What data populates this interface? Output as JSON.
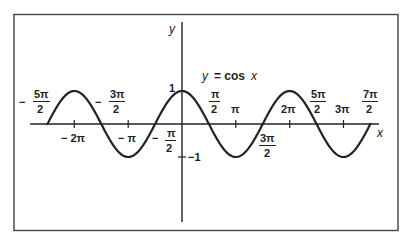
{
  "chart_data": {
    "type": "line",
    "title": "y = cos x",
    "xlabel": "x",
    "ylabel": "y",
    "function": "cos",
    "xlim_radians": [
      -7.854,
      10.996
    ],
    "ylim": [
      -1,
      1
    ],
    "x_range_plotted": [
      "-5π/2",
      "7π/2"
    ],
    "grid": false,
    "legend": null,
    "series": [
      {
        "name": "y = cos x",
        "x": [
          -7.854,
          -6.283,
          -4.712,
          -3.142,
          -1.571,
          0,
          1.571,
          3.142,
          4.712,
          6.283,
          7.854,
          9.425,
          10.996
        ],
        "x_labels": [
          "-5π/2",
          "-2π",
          "-3π/2",
          "-π",
          "-π/2",
          "0",
          "π/2",
          "π",
          "3π/2",
          "2π",
          "5π/2",
          "3π",
          "7π/2"
        ],
        "values": [
          0,
          1,
          0,
          -1,
          0,
          1,
          0,
          -1,
          0,
          1,
          0,
          -1,
          0
        ]
      }
    ],
    "x_tick_labels": [
      {
        "num": "5π",
        "den": "2",
        "sign": "−",
        "value": -7.854,
        "position": "above"
      },
      {
        "num": "2π",
        "den": "",
        "sign": "−",
        "value": -6.283,
        "position": "below"
      },
      {
        "num": "3π",
        "den": "2",
        "sign": "−",
        "value": -4.712,
        "position": "above"
      },
      {
        "num": "π",
        "den": "",
        "sign": "−",
        "value": -3.142,
        "position": "below"
      },
      {
        "num": "π",
        "den": "2",
        "sign": "−",
        "value": -1.571,
        "position": "below"
      },
      {
        "num": "π",
        "den": "2",
        "sign": "",
        "value": 1.571,
        "position": "above"
      },
      {
        "num": "π",
        "den": "",
        "sign": "",
        "value": 3.142,
        "position": "above"
      },
      {
        "num": "3π",
        "den": "2",
        "sign": "",
        "value": 4.712,
        "position": "below"
      },
      {
        "num": "2π",
        "den": "",
        "sign": "",
        "value": 6.283,
        "position": "above"
      },
      {
        "num": "5π",
        "den": "2",
        "sign": "",
        "value": 7.854,
        "position": "above"
      },
      {
        "num": "3π",
        "den": "",
        "sign": "",
        "value": 9.425,
        "position": "above"
      },
      {
        "num": "7π",
        "den": "2",
        "sign": "",
        "value": 10.996,
        "position": "above"
      }
    ],
    "y_tick_labels": [
      "1",
      "−1"
    ],
    "annotations": [
      "y = cos x"
    ]
  },
  "labels": {
    "equation": "y = cos x",
    "x_axis": "x",
    "y_axis": "y",
    "y_one": "1",
    "y_neg_one": "−1",
    "neg_5pi_2": {
      "sign": "−",
      "num": "5π",
      "den": "2"
    },
    "neg_2pi": "− 2π",
    "neg_3pi_2": {
      "sign": "−",
      "num": "3π",
      "den": "2"
    },
    "neg_pi": "− π",
    "neg_pi_2": {
      "sign": "−",
      "num": "π",
      "den": "2"
    },
    "pi_2": {
      "num": "π",
      "den": "2"
    },
    "pi": "π",
    "three_pi_2": {
      "num": "3π",
      "den": "2"
    },
    "two_pi": "2π",
    "five_pi_2": {
      "num": "5π",
      "den": "2"
    },
    "three_pi": "3π",
    "seven_pi_2": {
      "num": "7π",
      "den": "2"
    }
  },
  "colors": {
    "ink": "#222222",
    "frame": "#444444",
    "background": "#ffffff"
  }
}
